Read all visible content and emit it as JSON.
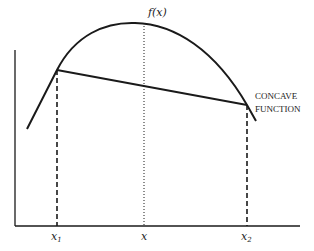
{
  "diagram": {
    "title": "Concave function",
    "curve_label": "f(x)",
    "annotation_lines": [
      "CONCAVE",
      "FUNCTION"
    ],
    "x_ticks": [
      {
        "base": "x",
        "sub": "1"
      },
      {
        "base": "x",
        "sub": ""
      },
      {
        "base": "x",
        "sub": "2"
      }
    ],
    "colors": {
      "line": "#1a1a1a",
      "background": "#ffffff"
    }
  }
}
